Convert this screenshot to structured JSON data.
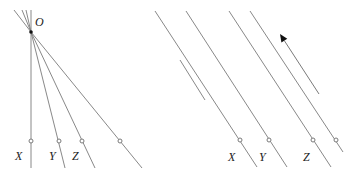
{
  "left_panel": {
    "origin_label": "O",
    "origin": [
      31,
      32
    ],
    "lines": [
      {
        "label": "X",
        "end": [
          31,
          168
        ],
        "marker": [
          31,
          141
        ],
        "label_pos": [
          15,
          160
        ]
      },
      {
        "label": "Y",
        "end": [
          65,
          168
        ],
        "marker": [
          59,
          141
        ],
        "label_pos": [
          49,
          160
        ]
      },
      {
        "label": "Z",
        "end": [
          95,
          168
        ],
        "marker": [
          82,
          141
        ],
        "label_pos": [
          72,
          160
        ]
      },
      {
        "label": "",
        "end": [
          142,
          168
        ],
        "marker": [
          120,
          141
        ],
        "label_pos": null
      }
    ],
    "extensions": [
      [
        14,
        10
      ],
      [
        22,
        10
      ],
      [
        26,
        10
      ],
      [
        31,
        10
      ]
    ]
  },
  "right_panel": {
    "lines": [
      {
        "label": "X",
        "start": [
          155,
          11
        ],
        "end": [
          257,
          167
        ],
        "marker": [
          240,
          140
        ],
        "label_pos": [
          228,
          161
        ]
      },
      {
        "label": "Y",
        "start": [
          186,
          11
        ],
        "end": [
          287,
          167
        ],
        "marker": [
          269,
          140
        ],
        "label_pos": [
          259,
          161
        ]
      },
      {
        "label": "Z",
        "start": [
          229,
          11
        ],
        "end": [
          331,
          167
        ],
        "marker": [
          313,
          140
        ],
        "label_pos": [
          303,
          161
        ]
      },
      {
        "label": "",
        "start": [
          250,
          11
        ],
        "end": [
          343,
          152
        ],
        "marker": [
          336,
          140
        ],
        "label_pos": null
      }
    ],
    "extra_line": {
      "start": [
        180,
        60
      ],
      "end": [
        205,
        100
      ]
    },
    "arrow": {
      "head": [
        280,
        34
      ],
      "tail": [
        319,
        94
      ]
    }
  },
  "colors": {
    "line": "#7a7a7a",
    "marker": "#7a7a7a",
    "arrow": "#111111",
    "text": "#222222"
  }
}
